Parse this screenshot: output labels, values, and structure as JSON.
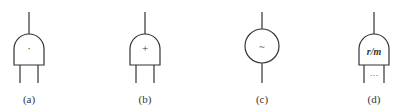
{
  "figure": {
    "symbols": [
      {
        "id": "a",
        "shape": "dome",
        "mark": "·",
        "label": "(a)",
        "cx": 29
      },
      {
        "id": "b",
        "shape": "dome",
        "mark": "+",
        "label": "(b)",
        "cx": 145
      },
      {
        "id": "c",
        "shape": "circle",
        "mark": "~",
        "label": "(c)",
        "cx": 262
      },
      {
        "id": "d",
        "shape": "dome",
        "mark": "r/m",
        "label": "(d)",
        "cx": 374,
        "extra": "···"
      }
    ],
    "stroke_color": "#333333",
    "background": "#ffffff"
  }
}
